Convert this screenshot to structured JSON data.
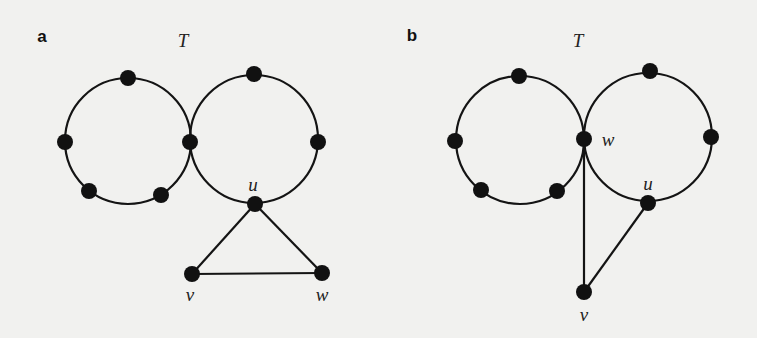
{
  "figure": {
    "background": "#f1f1ef",
    "ink_color": "#111111",
    "node_radius": 8,
    "panels": [
      {
        "id": "a",
        "label": "a",
        "label_pos": [
          42,
          42
        ],
        "graph_title": "T",
        "graph_title_pos": [
          183,
          47
        ],
        "cycles": [
          {
            "name": "left-cycle",
            "cx": 128,
            "cy": 141,
            "r": 63
          },
          {
            "name": "right-cycle",
            "cx": 254,
            "cy": 139,
            "r": 64
          }
        ],
        "nodes": [
          {
            "name": "left-top",
            "x": 128,
            "y": 78,
            "label": ""
          },
          {
            "name": "left-left",
            "x": 65,
            "y": 142,
            "label": ""
          },
          {
            "name": "shared",
            "x": 190,
            "y": 142,
            "label": ""
          },
          {
            "name": "left-bottom-left",
            "x": 89,
            "y": 191,
            "label": ""
          },
          {
            "name": "left-bottom-right",
            "x": 161,
            "y": 195,
            "label": ""
          },
          {
            "name": "right-top",
            "x": 254,
            "y": 74,
            "label": ""
          },
          {
            "name": "right-right",
            "x": 318,
            "y": 142,
            "label": ""
          },
          {
            "name": "u",
            "x": 255,
            "y": 204,
            "label": "u",
            "label_pos": [
              253,
              191
            ]
          },
          {
            "name": "v",
            "x": 192,
            "y": 274,
            "label": "v",
            "label_pos": [
              190,
              301
            ]
          },
          {
            "name": "w",
            "x": 322,
            "y": 273,
            "label": "w",
            "label_pos": [
              322,
              301
            ]
          }
        ],
        "edges": [
          [
            "u",
            "v"
          ],
          [
            "u",
            "w"
          ],
          [
            "v",
            "w"
          ]
        ]
      },
      {
        "id": "b",
        "label": "b",
        "label_pos": [
          412,
          41
        ],
        "graph_title": "T",
        "graph_title_pos": [
          578,
          47
        ],
        "cycles": [
          {
            "name": "left-cycle",
            "cx": 520,
            "cy": 140,
            "r": 64
          },
          {
            "name": "right-cycle",
            "cx": 648,
            "cy": 137,
            "r": 64
          }
        ],
        "nodes": [
          {
            "name": "left-top",
            "x": 519,
            "y": 76,
            "label": ""
          },
          {
            "name": "left-left",
            "x": 455,
            "y": 141,
            "label": ""
          },
          {
            "name": "w",
            "x": 584,
            "y": 139,
            "label": "w",
            "label_pos": [
              608,
              146
            ]
          },
          {
            "name": "left-bottom-left",
            "x": 481,
            "y": 190,
            "label": ""
          },
          {
            "name": "left-bottom-right",
            "x": 557,
            "y": 191,
            "label": ""
          },
          {
            "name": "right-top",
            "x": 650,
            "y": 71,
            "label": ""
          },
          {
            "name": "right-right",
            "x": 711,
            "y": 137,
            "label": ""
          },
          {
            "name": "u",
            "x": 648,
            "y": 203,
            "label": "u",
            "label_pos": [
              648,
              190
            ]
          },
          {
            "name": "v",
            "x": 584,
            "y": 292,
            "label": "v",
            "label_pos": [
              584,
              321
            ]
          }
        ],
        "edges": [
          [
            "w",
            "v"
          ],
          [
            "u",
            "v"
          ]
        ]
      }
    ]
  }
}
